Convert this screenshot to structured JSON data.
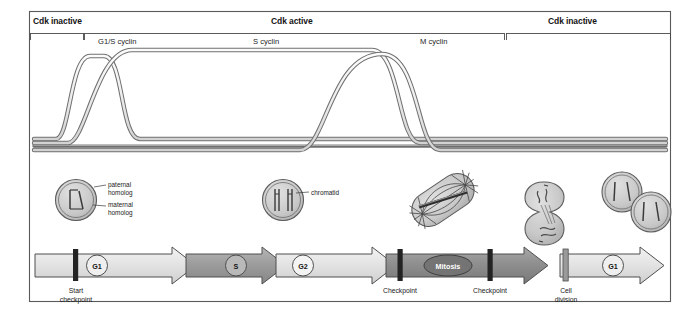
{
  "figure": {
    "frame_color": "#5a5a5a",
    "background": "#ffffff"
  },
  "cdk_phases": [
    {
      "label": "Cdk inactive",
      "start_x": 30,
      "end_x": 83
    },
    {
      "label": "Cdk active",
      "start_x": 83,
      "end_x": 505
    },
    {
      "label": "Cdk inactive",
      "start_x": 505,
      "end_x": 670
    }
  ],
  "cyclin_curves": [
    {
      "label": "G1/S cyclin",
      "label_x": 98,
      "label_y": 41,
      "color": "#8c8c8c"
    },
    {
      "label": "S cyclin",
      "label_x": 253,
      "label_y": 41,
      "color": "#8c8c8c"
    },
    {
      "label": "M cyclin",
      "label_x": 420,
      "label_y": 41,
      "color": "#8c8c8c"
    }
  ],
  "cell_illustrations": [
    {
      "name": "g1-cell",
      "cx": 76,
      "cy": 200,
      "labels": [
        {
          "text": "paternal",
          "x": 108,
          "y": 185
        },
        {
          "text": "homolog",
          "x": 108,
          "y": 192
        },
        {
          "text": "maternal",
          "x": 108,
          "y": 205
        },
        {
          "text": "homolog",
          "x": 108,
          "y": 212
        }
      ]
    },
    {
      "name": "s-g2-cell",
      "cx": 283,
      "cy": 200,
      "labels": [
        {
          "text": "chromatid",
          "x": 310,
          "y": 196
        }
      ]
    },
    {
      "name": "mitosis-cell",
      "cx": 443,
      "cy": 200,
      "labels": []
    },
    {
      "name": "dividing-cell",
      "cx": 558,
      "cy": 205,
      "labels": []
    },
    {
      "name": "daughter-cells",
      "cx": 638,
      "cy": 202,
      "labels": []
    }
  ],
  "phase_bar": {
    "segments": [
      {
        "label": "G1",
        "type": "light",
        "marker": "circle"
      },
      {
        "label": "S",
        "type": "mid",
        "marker": "circle"
      },
      {
        "label": "G2",
        "type": "light",
        "marker": "circle"
      },
      {
        "label": "Mitosis",
        "type": "dark",
        "marker": "oval"
      },
      {
        "label": "G1",
        "type": "light",
        "marker": "circle"
      }
    ],
    "markers": [
      {
        "label_line1": "Start",
        "label_line2": "checkpoint",
        "x": 76
      },
      {
        "label_line1": "Checkpoint",
        "label_line2": "",
        "x": 400
      },
      {
        "label_line1": "Checkpoint",
        "label_line2": "",
        "x": 490
      },
      {
        "label_line1": "Cell",
        "label_line2": "division",
        "x": 566
      }
    ],
    "colors": {
      "light": "#dcdcdc",
      "mid": "#9e9e9e",
      "dark": "#4a4a4a",
      "outline": "#4f4f4f",
      "bar_dark": "#2a2a2a"
    }
  }
}
